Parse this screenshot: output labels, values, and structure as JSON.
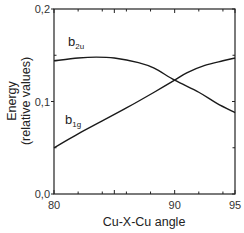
{
  "chart_data": {
    "type": "line",
    "title": "",
    "xlabel": "Cu-X-Cu angle",
    "ylabel": "Energy",
    "ylabel_sub": "(relative values)",
    "xlim": [
      80,
      95
    ],
    "ylim": [
      0.0,
      0.2
    ],
    "xticks": [
      80,
      90,
      95
    ],
    "xtick_labels": [
      "80",
      "90",
      "95"
    ],
    "yticks": [
      0.0,
      0.1,
      0.2
    ],
    "ytick_labels": [
      "0,0",
      "0,1",
      "0,2"
    ],
    "grid": false,
    "legend": "inline labels",
    "series": [
      {
        "name": "b2u",
        "label_main": "b",
        "label_sub": "2u",
        "x": [
          80,
          82,
          83.5,
          85,
          87,
          88.3,
          90,
          92,
          93.5,
          95
        ],
        "values": [
          0.144,
          0.147,
          0.148,
          0.147,
          0.142,
          0.136,
          0.123,
          0.11,
          0.098,
          0.088
        ]
      },
      {
        "name": "b1g",
        "label_main": "b",
        "label_sub": "1g",
        "x": [
          80,
          82,
          84,
          86,
          88.3,
          90,
          91,
          92.5,
          94,
          95
        ],
        "values": [
          0.05,
          0.065,
          0.079,
          0.093,
          0.11,
          0.123,
          0.131,
          0.139,
          0.144,
          0.147
        ]
      }
    ]
  }
}
